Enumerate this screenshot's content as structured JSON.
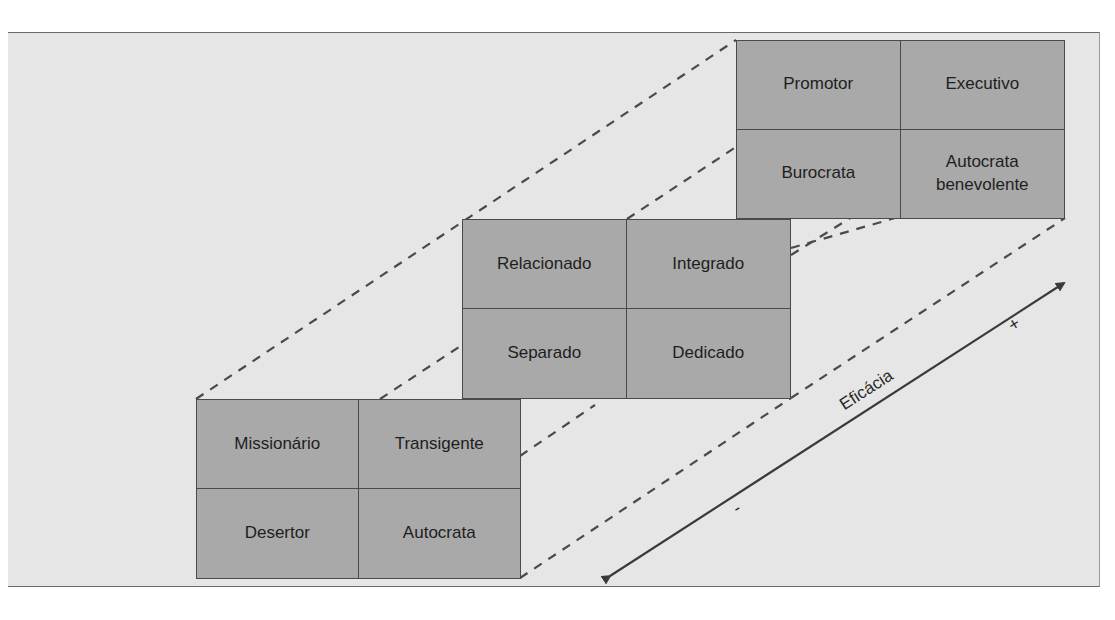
{
  "diagram": {
    "type": "managerial-styles-3d-effectiveness",
    "axis": {
      "label": "Eficácia",
      "plus_sign": "+",
      "minus_sign": "-"
    },
    "levels": [
      {
        "name": "high-effectiveness",
        "cells": [
          "Promotor",
          "Executivo",
          "Burocrata",
          "Autocrata benevolente"
        ]
      },
      {
        "name": "basic-styles",
        "cells": [
          "Relacionado",
          "Integrado",
          "Separado",
          "Dedicado"
        ]
      },
      {
        "name": "low-effectiveness",
        "cells": [
          "Missionário",
          "Transigente",
          "Desertor",
          "Autocrata"
        ]
      }
    ],
    "colors": {
      "background": "#e6e6e6",
      "cell_fill": "#a9a9a9",
      "line": "#4a4a4a"
    }
  }
}
